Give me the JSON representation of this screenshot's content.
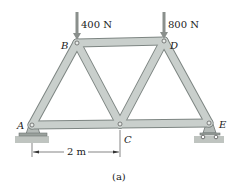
{
  "diagram": {
    "type": "truss",
    "caption": "(a)",
    "joints": [
      {
        "id": "A",
        "label": "A"
      },
      {
        "id": "B",
        "label": "B"
      },
      {
        "id": "C",
        "label": "C"
      },
      {
        "id": "D",
        "label": "D"
      },
      {
        "id": "E",
        "label": "E"
      }
    ],
    "members": [
      "AB",
      "BC",
      "BD",
      "CD",
      "DE",
      "AC",
      "CE"
    ],
    "loads": [
      {
        "joint": "B",
        "label": "400 N"
      },
      {
        "joint": "D",
        "label": "800 N"
      }
    ],
    "dimension": {
      "from": "A",
      "to": "C",
      "label": "2 m"
    },
    "supports": [
      {
        "joint": "A",
        "type": "pin"
      },
      {
        "joint": "E",
        "type": "roller"
      }
    ],
    "colors": {
      "member_fill": "#c9cfcc",
      "member_stroke": "#7d8582",
      "ground": "#b9beba",
      "arrow": "#8a8f8c"
    }
  }
}
